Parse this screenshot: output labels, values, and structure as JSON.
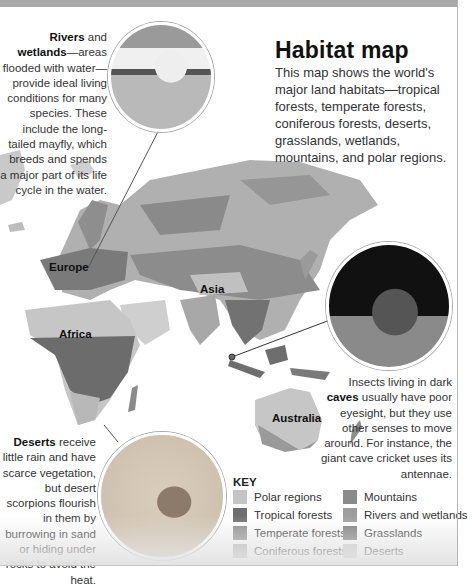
{
  "header": {
    "title": "Habitat map",
    "intro": "This map shows the world's major land habitats—tropical forests, temperate forests, coniferous forests, deserts, grasslands, wetlands, mountains, and polar regions."
  },
  "captions": {
    "rivers": {
      "bold": "Rivers",
      "mid": " and ",
      "bold2": "wetlands",
      "text": "—areas flooded with water—provide ideal living conditions for many species. These include the long-tailed mayfly, which breeds and spends a major part of its life cycle in the water."
    },
    "caves": {
      "pre": "Insects living in dark ",
      "bold": "caves",
      "text": " usually have poor eyesight, but they use other senses to move around. For instance, the giant cave cricket uses its antennae."
    },
    "deserts": {
      "bold": "Deserts",
      "text": " receive little rain and have scarce vegetation, but desert scorpions flourish in them by burrowing in sand or hiding under rocks to avoid the heat."
    }
  },
  "map_labels": {
    "europe": "Europe",
    "asia": "Asia",
    "africa": "Africa",
    "australia": "Australia"
  },
  "photos": {
    "mayfly": "mayfly photo",
    "cricket": "giant cave cricket photo",
    "scorpion": "desert scorpion photo"
  },
  "key": {
    "title": "KEY",
    "items": [
      {
        "label": "Polar regions",
        "color": "#c4c4c4"
      },
      {
        "label": "Mountains",
        "color": "#8a8a8a"
      },
      {
        "label": "Tropical forests",
        "color": "#6e6e6e"
      },
      {
        "label": "Rivers and wetlands",
        "color": "#9d9d9d"
      },
      {
        "label": "Temperate forests",
        "color": "#8c8c8c"
      },
      {
        "label": "Grasslands",
        "color": "#7c7c7c"
      },
      {
        "label": "Coniferous forests",
        "color": "#b4b4b4"
      },
      {
        "label": "Deserts",
        "color": "#cdcdcd"
      }
    ]
  }
}
